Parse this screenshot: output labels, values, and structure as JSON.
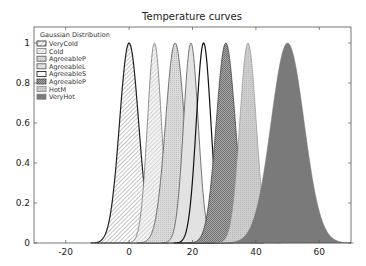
{
  "chart_data": {
    "type": "area",
    "title": "Temperature curves",
    "xlabel": "",
    "ylabel": "",
    "xlim": [
      -30,
      70
    ],
    "ylim": [
      0,
      1.08
    ],
    "xticks": [
      -20,
      0,
      20,
      40,
      60
    ],
    "yticks": [
      0,
      0.2,
      0.4,
      0.6,
      0.8,
      1
    ],
    "ytick_labels": [
      "0",
      "0.2",
      "0.4",
      "0.6",
      "0.8",
      "1"
    ],
    "grid": false,
    "legend": {
      "title": "Gaussian Distribution",
      "position": "upper left"
    },
    "series": [
      {
        "name": "VeryCold",
        "kind": "gaussian",
        "mean": 0,
        "sigma": 3.0,
        "peak": 1,
        "fill": "hatch-diag",
        "fill_color": "#ffffff",
        "edge": "#222222",
        "edge_width": 1.2
      },
      {
        "name": "Cold",
        "kind": "gaussian",
        "mean": 8,
        "sigma": 2.2,
        "peak": 1,
        "fill": "hatch-diag-light",
        "fill_color": "#f2f2f2",
        "edge": "#777777",
        "edge_width": 0.8
      },
      {
        "name": "AgreeableP",
        "kind": "gaussian",
        "mean": 14.5,
        "sigma": 3.0,
        "peak": 1,
        "fill": "dots",
        "fill_color": "#d6d6d6",
        "edge": "#555555",
        "edge_width": 0.8
      },
      {
        "name": "AgreeableL",
        "kind": "gaussian",
        "mean": 19.5,
        "sigma": 2.3,
        "peak": 1,
        "fill": "solid",
        "fill_color": "#e2e2e2",
        "edge": "#555555",
        "edge_width": 0.8
      },
      {
        "name": "AgreeableS",
        "kind": "gaussian",
        "mean": 23.5,
        "sigma": 2.3,
        "peak": 1,
        "fill": "none",
        "fill_color": "#ffffff",
        "edge": "#111111",
        "edge_width": 1.2
      },
      {
        "name": "AgreeableP",
        "kind": "gaussian",
        "mean": 30.5,
        "sigma": 3.0,
        "peak": 1,
        "fill": "crosshatch",
        "fill_color": "#9a9a9a",
        "edge": "#444444",
        "edge_width": 0.8
      },
      {
        "name": "HotM",
        "kind": "gaussian",
        "mean": 37.5,
        "sigma": 2.6,
        "peak": 1,
        "fill": "dots-light",
        "fill_color": "#c8c8c8",
        "edge": "#888888",
        "edge_width": 0.6
      },
      {
        "name": "VeryHot",
        "kind": "gaussian",
        "mean": 50,
        "sigma": 5.2,
        "peak": 1,
        "fill": "solid",
        "fill_color": "#7a7a7a",
        "edge": "#7a7a7a",
        "edge_width": 0.5
      }
    ]
  },
  "plot_box": {
    "left": 34,
    "top": 27,
    "right": 351,
    "bottom": 243
  }
}
